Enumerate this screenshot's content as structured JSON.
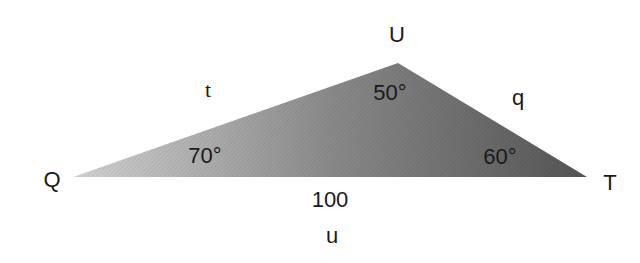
{
  "diagram": {
    "type": "triangle",
    "vertices": [
      {
        "name": "Q",
        "x": 73,
        "y": 177,
        "angle": "70°"
      },
      {
        "name": "U",
        "x": 398,
        "y": 63,
        "angle": "50°"
      },
      {
        "name": "T",
        "x": 587,
        "y": 177,
        "angle": "60°"
      }
    ],
    "sides": [
      {
        "name": "t",
        "between": "Q-U"
      },
      {
        "name": "q",
        "between": "U-T"
      },
      {
        "name": "u",
        "between": "Q-T",
        "length": "100"
      }
    ],
    "colors": {
      "fill_light": "#d0d0d0",
      "fill_dark": "#5a5a5a",
      "text": "#1a1a1a"
    }
  },
  "labels": {
    "vertex_q": "Q",
    "vertex_u": "U",
    "vertex_t": "T",
    "side_t": "t",
    "side_q": "q",
    "side_u": "u",
    "angle_q": "70°",
    "angle_u": "50°",
    "angle_t": "60°",
    "base_length": "100"
  }
}
